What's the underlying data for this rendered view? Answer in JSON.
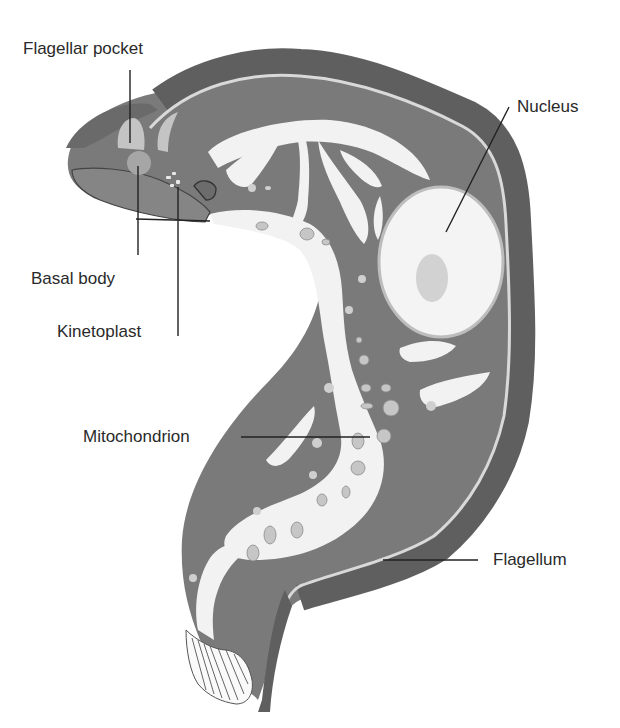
{
  "diagram": {
    "colors": {
      "background": "#ffffff",
      "cytoplasm": "#7a7a7a",
      "membrane": "#626262",
      "mitochondrion": "#f2f2f2",
      "nucleus": "#f4f4f4",
      "nucleolus": "#d2d2d2",
      "granules": "#c6c6c6",
      "label_text": "#2a2a2a",
      "leader_line": "#222222"
    },
    "labels": {
      "flagellar_pocket": "Flagellar pocket",
      "nucleus": "Nucleus",
      "basal_body": "Basal body",
      "kinetoplast": "Kinetoplast",
      "mitochondrion": "Mitochondrion",
      "flagellum": "Flagellum"
    }
  }
}
